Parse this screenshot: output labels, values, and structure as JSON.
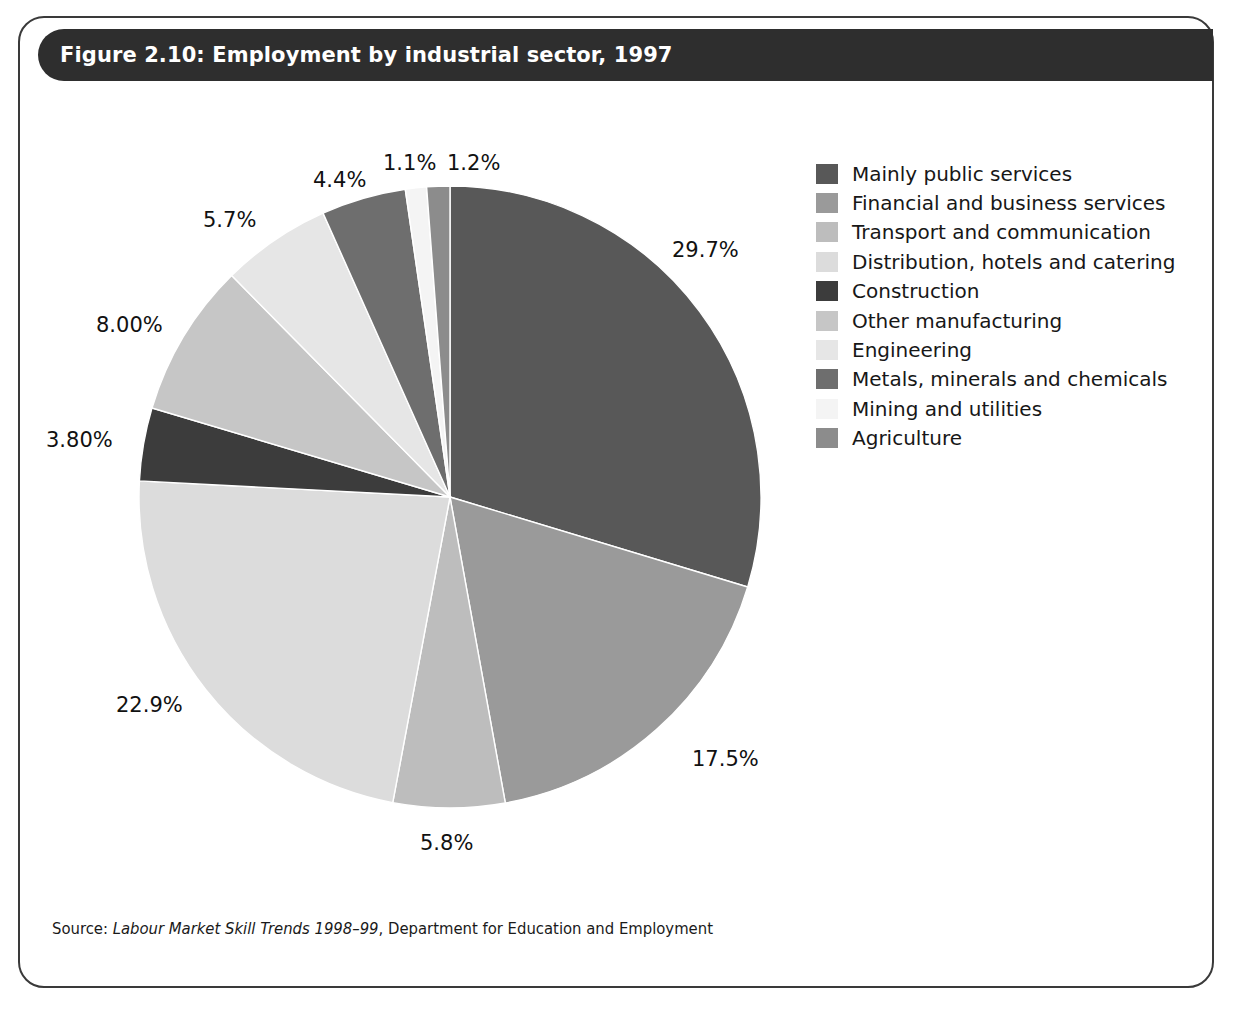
{
  "figure": {
    "title": "Figure 2.10: Employment by industrial sector, 1997",
    "source_prefix": "Source: ",
    "source_italic": "Labour Market Skill Trends 1998–99",
    "source_rest": ", Department for Education and Employment"
  },
  "colors": {
    "title_bar": "#2e2e2e",
    "card_border": "#3a3a3a",
    "page_background": "#ffffff",
    "label_text": "#111111"
  },
  "legend": {
    "items": [
      {
        "label": "Mainly public services",
        "color": "#585858"
      },
      {
        "label": "Financial and business services",
        "color": "#9a9a9a"
      },
      {
        "label": "Transport and communication",
        "color": "#bdbdbd"
      },
      {
        "label": "Distribution, hotels and catering",
        "color": "#dcdcdc"
      },
      {
        "label": "Construction",
        "color": "#3c3c3c"
      },
      {
        "label": "Other manufacturing",
        "color": "#c6c6c6"
      },
      {
        "label": "Engineering",
        "color": "#e6e6e6"
      },
      {
        "label": "Metals, minerals and chemicals",
        "color": "#6e6e6e"
      },
      {
        "label": "Mining and utilities",
        "color": "#f4f4f4"
      },
      {
        "label": "Agriculture",
        "color": "#8c8c8c"
      }
    ]
  },
  "chart_data": {
    "type": "pie",
    "title": "Figure 2.10: Employment by industrial sector, 1997",
    "subtitle": "",
    "xlabel": "",
    "ylabel": "",
    "legend_position": "right",
    "grid": false,
    "units": "percent",
    "start_angle_deg": 0,
    "direction": "clockwise",
    "center": {
      "x": 450,
      "y": 497
    },
    "radius": 311,
    "labels": [
      "Mainly public services",
      "Financial and business services",
      "Transport and communication",
      "Distribution, hotels and catering",
      "Construction",
      "Other manufacturing",
      "Engineering",
      "Metals, minerals and chemicals",
      "Mining and utilities",
      "Agriculture"
    ],
    "values": [
      29.7,
      17.5,
      5.8,
      22.9,
      3.8,
      8.0,
      5.7,
      4.4,
      1.1,
      1.2
    ],
    "value_labels": [
      "29.7%",
      "17.5%",
      "5.8%",
      "22.9%",
      "3.80%",
      "8.00%",
      "5.7%",
      "4.4%",
      "1.1%",
      "1.2%"
    ],
    "colors": [
      "#585858",
      "#9a9a9a",
      "#bdbdbd",
      "#dcdcdc",
      "#3c3c3c",
      "#c6c6c6",
      "#e6e6e6",
      "#6e6e6e",
      "#f4f4f4",
      "#8c8c8c"
    ],
    "slices": [
      {
        "label": "Mainly public services",
        "value": 29.7,
        "value_label": "29.7%",
        "color": "#585858",
        "label_pos": {
          "x": 672,
          "y": 238
        }
      },
      {
        "label": "Financial and business services",
        "value": 17.5,
        "value_label": "17.5%",
        "color": "#9a9a9a",
        "label_pos": {
          "x": 692,
          "y": 747
        }
      },
      {
        "label": "Transport and communication",
        "value": 5.8,
        "value_label": "5.8%",
        "color": "#bdbdbd",
        "label_pos": {
          "x": 420,
          "y": 831
        }
      },
      {
        "label": "Distribution, hotels and catering",
        "value": 22.9,
        "value_label": "22.9%",
        "color": "#dcdcdc",
        "label_pos": {
          "x": 116,
          "y": 693
        }
      },
      {
        "label": "Construction",
        "value": 3.8,
        "value_label": "3.80%",
        "color": "#3c3c3c",
        "label_pos": {
          "x": 46,
          "y": 428
        }
      },
      {
        "label": "Other manufacturing",
        "value": 8.0,
        "value_label": "8.00%",
        "color": "#c6c6c6",
        "label_pos": {
          "x": 96,
          "y": 313
        }
      },
      {
        "label": "Engineering",
        "value": 5.7,
        "value_label": "5.7%",
        "color": "#e6e6e6",
        "label_pos": {
          "x": 203,
          "y": 208
        }
      },
      {
        "label": "Metals, minerals and chemicals",
        "value": 4.4,
        "value_label": "4.4%",
        "color": "#6e6e6e",
        "label_pos": {
          "x": 313,
          "y": 168
        }
      },
      {
        "label": "Mining and utilities",
        "value": 1.1,
        "value_label": "1.1%",
        "color": "#f4f4f4",
        "label_pos": {
          "x": 383,
          "y": 151
        }
      },
      {
        "label": "Agriculture",
        "value": 1.2,
        "value_label": "1.2%",
        "color": "#8c8c8c",
        "label_pos": {
          "x": 447,
          "y": 151
        }
      }
    ]
  }
}
